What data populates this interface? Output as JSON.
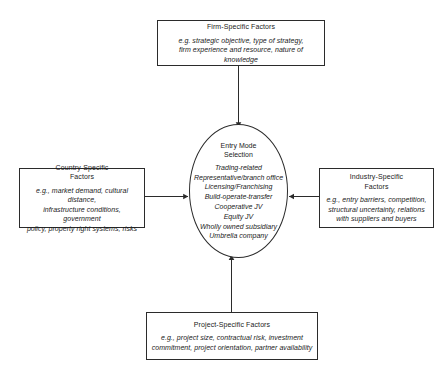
{
  "diagram": {
    "line_color": "#2b2b2b",
    "background": "#ffffff"
  },
  "center": {
    "heading": "Entry Mode\nSelection",
    "modes": [
      "Trading-related",
      "Representative/branch office",
      "Licensing/Franchising",
      "Build-operate-transfer",
      "Cooperative JV",
      "Equity JV",
      "Wholly owned subsidiary",
      "Umbrella company"
    ]
  },
  "boxes": {
    "firm": {
      "title": "Firm-Specific Factors",
      "detail": "e.g. strategic objective, type of strategy,\nfirm experience and resource, nature of knowledge"
    },
    "country": {
      "title": "Country-Specific\nFactors",
      "detail": "e.g., market demand, cultural distance,\ninfrastructure conditions, government\npolicy, property right systems, risks"
    },
    "industry": {
      "title": "Industry-Specific\nFactors",
      "detail": "e.g., entry barriers, competition,\nstructural uncertainty, relations\nwith suppliers and buyers"
    },
    "project": {
      "title": "Project-Specific Factors",
      "detail": "e.g., project size, contractual risk, investment\ncommitment, project orientation, partner availability"
    }
  },
  "connectors": [
    {
      "name": "firm-to-center",
      "direction": "down"
    },
    {
      "name": "country-to-center",
      "direction": "right"
    },
    {
      "name": "industry-to-center",
      "direction": "left"
    },
    {
      "name": "project-to-center",
      "direction": "up"
    }
  ]
}
